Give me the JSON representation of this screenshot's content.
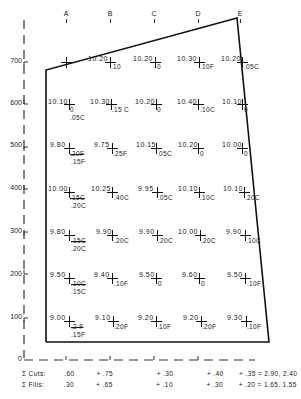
{
  "diagram": {
    "columns": [
      "A",
      "B",
      "C",
      "D",
      "E"
    ],
    "y_axis": {
      "labels": [
        "700",
        "600",
        "500",
        "400",
        "300",
        "200",
        "100",
        "0"
      ]
    },
    "grid": [
      [
        {
          "elev": "",
          "cf": ""
        },
        {
          "elev": "10.20",
          "cf": ".10"
        },
        {
          "elev": "10.20",
          "cf": "0"
        },
        {
          "elev": "10.30",
          "cf": ".10F"
        },
        {
          "elev": "10.20",
          "cf": ".05C"
        }
      ],
      [
        {
          "elev": "10.10",
          "cf": "0",
          "cf2": ".05C"
        },
        {
          "elev": "10.30",
          "cf": ".15 C"
        },
        {
          "elev": "10.20",
          "cf": "0"
        },
        {
          "elev": "10.40",
          "cf": ".10C"
        },
        {
          "elev": "10.10",
          "cf": "0"
        }
      ],
      [
        {
          "elev": "9.80",
          "cf": ".20F",
          "cf2": ".15F"
        },
        {
          "elev": "9.75",
          "cf": ".25F"
        },
        {
          "elev": "10.15",
          "cf": ".05C"
        },
        {
          "elev": "10.20",
          "cf": "0"
        },
        {
          "elev": "10.00",
          "cf": "0"
        }
      ],
      [
        {
          "elev": "10.00",
          "cf": ".15C",
          "cf2": ".20C"
        },
        {
          "elev": "10.25",
          "cf": ".40C"
        },
        {
          "elev": "9.95",
          "cf": ".05C"
        },
        {
          "elev": "10.10",
          "cf": ".10C"
        },
        {
          "elev": "10.10",
          "cf": ".20C"
        }
      ],
      [
        {
          "elev": "9.80",
          "cf": ".15C",
          "cf2": ".20C"
        },
        {
          "elev": "9.90",
          "cf": ".20C"
        },
        {
          "elev": "9.90",
          "cf": ".20C"
        },
        {
          "elev": "10.00",
          "cf": ".20C"
        },
        {
          "elev": "9.90",
          "cf": ".10C"
        }
      ],
      [
        {
          "elev": "9.50",
          "cf": ".10C",
          "cf2": ".15C"
        },
        {
          "elev": "9.40",
          "cf": ".10F"
        },
        {
          "elev": "9.50",
          "cf": "0"
        },
        {
          "elev": "9.60",
          "cf": "0"
        },
        {
          "elev": "9.50",
          "cf": ".10F"
        }
      ],
      [
        {
          "elev": "9.00",
          "cf": ".2 F",
          "cf2": ".15F"
        },
        {
          "elev": "9.10",
          "cf": ".20F"
        },
        {
          "elev": "9.20",
          "cf": ".10F"
        },
        {
          "elev": "9.20",
          "cf": ".20F"
        },
        {
          "elev": "9.30",
          "cf": ".10F"
        }
      ]
    ],
    "summary": {
      "cuts": {
        "label": "Σ Cuts:",
        "v1": ".60",
        "v2": "+ .75",
        "v3": "+ .30",
        "v4": "+ .40",
        "v5": "+  .35 = 2.90, 2.40"
      },
      "fills": {
        "label": "Σ Fills:",
        "v1": ".30",
        "v2": "+ .65",
        "v3": "+ .10",
        "v4": "+ .30",
        "v5": "+  .20 = 1.65, 1.55"
      }
    },
    "colors": {
      "line": "#111111",
      "text": "#1a1a1a"
    }
  }
}
